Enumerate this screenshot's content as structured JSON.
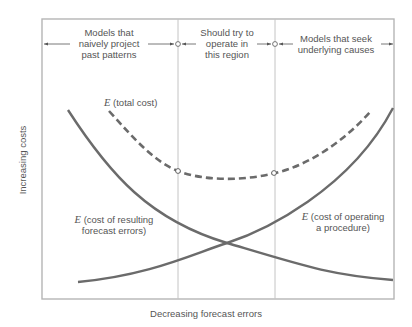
{
  "diagram": {
    "regions": [
      {
        "label_lines": [
          "Models that",
          "naively project",
          "past patterns"
        ]
      },
      {
        "label_lines": [
          "Should try to",
          "operate in",
          "this region"
        ]
      },
      {
        "label_lines": [
          "Models that seek",
          "underlying causes"
        ]
      }
    ],
    "curves": {
      "total": {
        "prefix": "E",
        "text": " (total cost)"
      },
      "errors": {
        "prefix": "E",
        "line1": " (cost of resulting",
        "line2": "forecast errors)"
      },
      "operating": {
        "prefix": "E",
        "line1": " (cost of operating",
        "line2": "a procedure)"
      }
    },
    "axes": {
      "x_label": "Decreasing forecast errors",
      "y_label": "Increasing costs"
    },
    "colors": {
      "frame": "#b5b5b5",
      "divider": "#c4c4c4",
      "curve": "#6b6b6b",
      "text": "#555555"
    }
  }
}
